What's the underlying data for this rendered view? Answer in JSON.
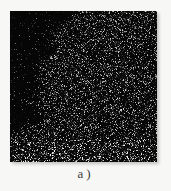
{
  "page": {
    "background": "#f7f7f5"
  },
  "figure": {
    "caption": "a)",
    "caption_color": "#3f3f3f",
    "image": {
      "type": "noise-micrograph",
      "description": "dark speckle map (elemental mapping style) with sparse dark blob along left edge",
      "background": "#060606",
      "width": 147,
      "height": 151,
      "seed": 1337,
      "dot_density": 0.38,
      "dot_min_brightness": 18,
      "dot_brightness_range": 200,
      "dot_gamma": 2.4,
      "dark_region": {
        "side": "left",
        "base_width": 32,
        "wave1_amp": 8,
        "wave1_freq": 0.06,
        "wave2_amp": 6,
        "wave2_freq": 0.18,
        "wave2_phase": 1.0,
        "top_flare_rows": 28,
        "top_flare_slope": 1.0,
        "edge_softness": 10,
        "edge_jitter": 10,
        "density": 0.05,
        "brightness_scale": 0.55,
        "fade_start_y": 100,
        "fade_length": 26
      },
      "bottom_strip": {
        "start_y": 128,
        "density_boost": 1.15,
        "brightness_boost": 1.25
      }
    }
  }
}
